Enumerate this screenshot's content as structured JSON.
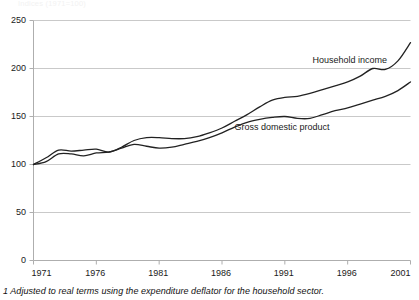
{
  "figure": {
    "top_label": "Indices (1971=100)",
    "footnote": "1 Adjusted to real terms using the expenditure deflator for the household sector.",
    "axis_color": "#aeaeae",
    "grid_color": "#c9c9c9",
    "line_color": "#222222",
    "background": "#ffffff"
  },
  "labels": {
    "household_income": "Household income",
    "gross_domestic_product": "Gross domestic product"
  },
  "chart_data": {
    "type": "line",
    "title": "",
    "subtitle": "",
    "xlabel": "",
    "ylabel": "",
    "xlim": [
      1971,
      2001
    ],
    "ylim": [
      0,
      250
    ],
    "grid": true,
    "grid_axis": "y",
    "legend": "inline-annotations",
    "x_ticks": [
      1971,
      1976,
      1981,
      1986,
      1991,
      1996,
      2001
    ],
    "y_ticks": [
      0,
      50,
      100,
      150,
      200,
      250
    ],
    "x": [
      1971,
      1972,
      1973,
      1974,
      1975,
      1976,
      1977,
      1978,
      1979,
      1980,
      1981,
      1982,
      1983,
      1984,
      1985,
      1986,
      1987,
      1988,
      1989,
      1990,
      1991,
      1992,
      1993,
      1994,
      1995,
      1996,
      1997,
      1998,
      1999,
      2000,
      2001
    ],
    "series": [
      {
        "name": "Household income",
        "values": [
          100,
          107,
          115,
          114,
          115,
          116,
          113,
          118,
          125,
          128,
          128,
          127,
          127,
          129,
          133,
          138,
          145,
          152,
          160,
          167,
          170,
          171,
          174,
          178,
          182,
          186,
          192,
          200,
          199,
          208,
          227
        ]
      },
      {
        "name": "Gross domestic product",
        "values": [
          100,
          103,
          111,
          111,
          109,
          112,
          113,
          117,
          121,
          119,
          117,
          118,
          121,
          124,
          128,
          133,
          139,
          144,
          147,
          149,
          150,
          148,
          148,
          152,
          156,
          159,
          163,
          167,
          171,
          177,
          186
        ]
      }
    ],
    "annotations": [
      {
        "text": "Household income",
        "x": 1993.2,
        "y": 208
      },
      {
        "text": "Gross domestic product",
        "x": 1987.0,
        "y": 138
      }
    ]
  }
}
